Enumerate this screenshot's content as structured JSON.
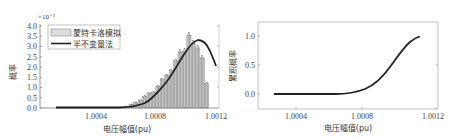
{
  "chart_data": [
    {
      "type": "bar",
      "title": "",
      "xlabel": "电压幅值(pu)",
      "ylabel": "概率",
      "y_multiplier": "×10⁻²",
      "xlim": [
        1.0,
        1.0012
      ],
      "ylim": [
        0,
        4.0
      ],
      "xticks": [
        "1.0004",
        "1.0008",
        "1.0012"
      ],
      "yticks": [
        "0.0",
        "0.5",
        "1.0",
        "1.5",
        "2.0",
        "2.5",
        "3.0",
        "3.5",
        "4.0"
      ],
      "legend": [
        "蒙特卡洛模拟",
        "半不变量法"
      ],
      "legend_position": "upper left",
      "series": [
        {
          "name": "蒙特卡洛模拟",
          "kind": "histogram",
          "x": [
            1.00058,
            1.00061,
            1.00064,
            1.00067,
            1.0007,
            1.00073,
            1.00076,
            1.00079,
            1.00082,
            1.00085,
            1.00088,
            1.00091,
            1.00094,
            1.00097,
            1.001,
            1.00103,
            1.00106,
            1.00109,
            1.00112,
            1.00115
          ],
          "values": [
            0.05,
            0.1,
            0.2,
            0.3,
            0.4,
            0.6,
            0.75,
            0.8,
            1.1,
            1.45,
            1.65,
            1.9,
            2.4,
            2.85,
            2.9,
            3.7,
            3.3,
            3.05,
            2.55,
            1.25
          ]
        },
        {
          "name": "半不变量法",
          "kind": "line",
          "x": [
            1.0002,
            1.0004,
            1.0005,
            1.0006,
            1.0007,
            1.0008,
            1.0009,
            1.00095,
            1.001,
            1.00104,
            1.00108,
            1.00112,
            1.00116
          ],
          "values": [
            0.0,
            0.0,
            0.02,
            0.12,
            0.42,
            1.05,
            2.05,
            2.6,
            3.05,
            3.22,
            3.05,
            2.55,
            1.75
          ]
        }
      ]
    },
    {
      "type": "line",
      "title": "",
      "xlabel": "电压幅值(pu)",
      "ylabel": "累积概率",
      "xlim": [
        1.0,
        1.0012
      ],
      "ylim": [
        -0.25,
        1.25
      ],
      "xticks": [
        "1.0004",
        "1.0008",
        "1.0012"
      ],
      "yticks": [
        "0.0",
        "0.5",
        "1.0"
      ],
      "series": [
        {
          "name": "累积概率",
          "x": [
            1.0002,
            1.0004,
            1.0005,
            1.0006,
            1.0007,
            1.0008,
            1.0009,
            1.001,
            1.00105,
            1.0011,
            1.00115
          ],
          "values": [
            0.0,
            0.0,
            0.0,
            0.01,
            0.04,
            0.12,
            0.3,
            0.58,
            0.74,
            0.88,
            0.97
          ]
        }
      ]
    }
  ],
  "left": {
    "multiplier": "×10⁻²",
    "ylabel": "概率",
    "xlabel": "电压幅值(pu)",
    "legend_mc": "蒙特卡洛模拟",
    "legend_cum": "半不变量法",
    "yt": [
      "0.0",
      "0.5",
      "1.0",
      "1.5",
      "2.0",
      "2.5",
      "3.0",
      "3.5",
      "4.0"
    ],
    "xt": [
      "1.0004",
      "1.0008",
      "1.0012"
    ]
  },
  "right": {
    "ylabel": "累积概率",
    "xlabel": "电压幅值(pu)",
    "yt": [
      "0.0",
      "0.5",
      "1.0"
    ],
    "xt": [
      "1.0004",
      "1.0008",
      "1.0012"
    ]
  }
}
